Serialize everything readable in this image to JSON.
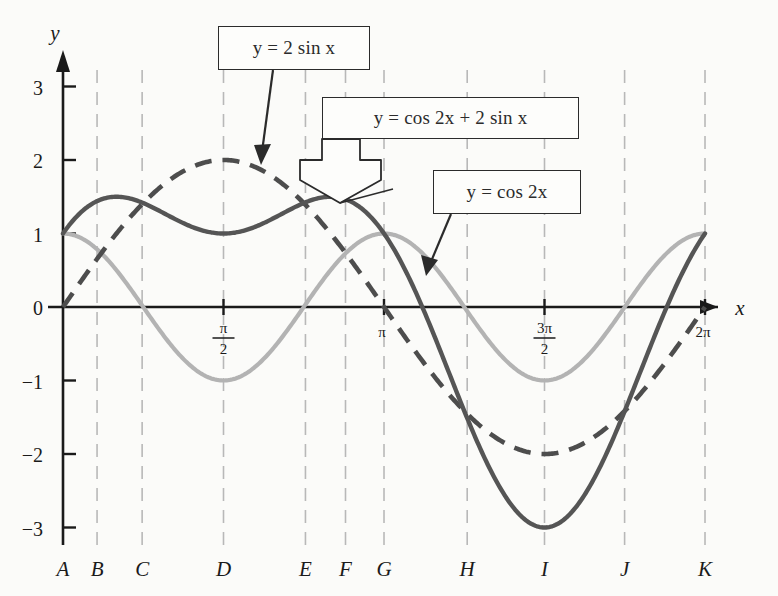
{
  "chart_data": {
    "type": "line",
    "title": "",
    "xlabel": "x",
    "ylabel": "y",
    "xlim": [
      -0.18,
      6.7
    ],
    "ylim": [
      -3.45,
      3.45
    ],
    "grid": true,
    "grid_orientation": "vertical",
    "legend_position": "callouts",
    "y_ticks": [
      "3",
      "2",
      "1",
      "0",
      "−1",
      "−2",
      "−3"
    ],
    "y_tick_values": [
      3,
      2,
      1,
      0,
      -1,
      -2,
      -3
    ],
    "x_ticks": [
      {
        "label_num": "π",
        "label_den": "2",
        "value": 1.5707963
      },
      {
        "label_num": "π",
        "label_den": "",
        "value": 3.1415927
      },
      {
        "label_num": "3π",
        "label_den": "2",
        "value": 4.712389
      },
      {
        "label_num": "2π",
        "label_den": "",
        "value": 6.2831853
      }
    ],
    "bottom_letters": [
      {
        "label": "A",
        "x_value": 0.0
      },
      {
        "label": "B",
        "x_value": 0.3333
      },
      {
        "label": "C",
        "x_value": 0.7745
      },
      {
        "label": "D",
        "x_value": 1.5707963
      },
      {
        "label": "E",
        "x_value": 2.3729
      },
      {
        "label": "F",
        "x_value": 2.7648
      },
      {
        "label": "G",
        "x_value": 3.1415927
      },
      {
        "label": "H",
        "x_value": 3.9559
      },
      {
        "label": "I",
        "x_value": 4.712389
      },
      {
        "label": "J",
        "x_value": 5.4963
      },
      {
        "label": "K",
        "x_value": 6.2831853
      }
    ],
    "series": [
      {
        "name": "y = cos 2x + 2 sin x",
        "expression": "cos(2x) + 2sin(x)",
        "style": "solid",
        "color": "#555555",
        "width": 4.4,
        "key_points": [
          {
            "x": 0.0,
            "y": 1.0
          },
          {
            "x": 0.3333,
            "y": 1.5
          },
          {
            "x": 0.7745,
            "y": 1.41
          },
          {
            "x": 1.5708,
            "y": 1.0
          },
          {
            "x": 2.3729,
            "y": 1.41
          },
          {
            "x": 2.7648,
            "y": 1.5
          },
          {
            "x": 3.1416,
            "y": 1.0
          },
          {
            "x": 3.9559,
            "y": -1.41
          },
          {
            "x": 4.7124,
            "y": -3.0
          },
          {
            "x": 5.4963,
            "y": -1.41
          },
          {
            "x": 6.2832,
            "y": 1.0
          }
        ]
      },
      {
        "name": "y = 2 sin x",
        "expression": "2sin(x)",
        "style": "dashed",
        "color": "#4d4d4d",
        "width": 4.6,
        "dash": "17,11",
        "key_points": [
          {
            "x": 0.0,
            "y": 0.0
          },
          {
            "x": 1.5708,
            "y": 2.0
          },
          {
            "x": 3.1416,
            "y": 0.0
          },
          {
            "x": 4.7124,
            "y": -2.0
          },
          {
            "x": 6.2832,
            "y": 0.0
          }
        ]
      },
      {
        "name": "y = cos 2x",
        "expression": "cos(2x)",
        "style": "solid",
        "color": "#b3b3b3",
        "width": 4.2,
        "key_points": [
          {
            "x": 0.0,
            "y": 1.0
          },
          {
            "x": 1.5708,
            "y": -1.0
          },
          {
            "x": 3.1416,
            "y": 1.0
          },
          {
            "x": 4.7124,
            "y": -1.0
          },
          {
            "x": 6.2832,
            "y": 1.0
          }
        ]
      }
    ],
    "annotations": [
      {
        "id": "callout-2sinx",
        "text": "y = 2 sin x",
        "pointer": "arrow",
        "target_series": "y = 2 sin x"
      },
      {
        "id": "callout-sum",
        "text": "y = cos 2x + 2 sin x",
        "pointer": "block-arrow",
        "target_series": "y = cos 2x + 2 sin x"
      },
      {
        "id": "callout-cos2x",
        "text": "y = cos 2x",
        "pointer": "arrow",
        "target_series": "y = cos 2x"
      }
    ]
  },
  "axes": {
    "y_axis_label": "y",
    "x_axis_label": "x"
  },
  "callouts": {
    "two_sin_x": "y = 2 sin x",
    "sum": "y = cos 2x + 2 sin x",
    "cos_two_x": "y = cos 2x"
  },
  "colors": {
    "sum_curve": "#555555",
    "sin_curve": "#4d4d4d",
    "cos_curve": "#b3b3b3",
    "axis": "#1a1a1a",
    "gridline": "#b8b8b8",
    "background": "#fbfbf9"
  }
}
